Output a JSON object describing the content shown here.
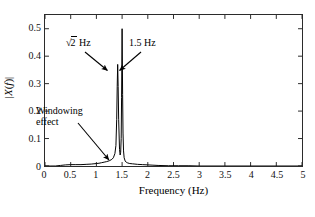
{
  "figure": {
    "background_color": "#ffffff",
    "line_color": "#000000",
    "axis_color": "#2b2b2b"
  },
  "annotations": {
    "peak_left": {
      "radical": "√",
      "radicand": "2",
      "unit": "Hz",
      "full_text": "√2 Hz"
    },
    "peak_right": {
      "text": "1.5 Hz"
    },
    "windowing": {
      "line1": "Windowing",
      "line2": "effect"
    }
  },
  "caption_sliver": {
    "text": ""
  },
  "chart_data": {
    "type": "line",
    "title": "",
    "xlabel": "Frequency (Hz)",
    "ylabel": "|X(f)|",
    "xlim": [
      0,
      5
    ],
    "ylim": [
      0,
      0.55
    ],
    "grid": false,
    "legend": null,
    "xticks": [
      0,
      0.5,
      1,
      1.5,
      2,
      2.5,
      3,
      3.5,
      4,
      4.5,
      5
    ],
    "xtick_labels": [
      "0",
      "0.5",
      "1",
      "1.5",
      "2",
      "2.5",
      "3",
      "3.5",
      "4",
      "4.5",
      "5"
    ],
    "yticks": [
      0,
      0.1,
      0.2,
      0.3,
      0.4,
      0.5
    ],
    "ytick_labels": [
      "0",
      "0.1",
      "0.2",
      "0.3",
      "0.4",
      "0.5"
    ],
    "peaks": [
      {
        "label": "√2 Hz",
        "x": 1.414,
        "y": 0.37
      },
      {
        "label": "1.5 Hz",
        "x": 1.5,
        "y": 0.5
      }
    ],
    "annotations": [
      {
        "text": "√2 Hz",
        "points_to_x": 1.414,
        "points_to_y": 0.33
      },
      {
        "text": "1.5 Hz",
        "points_to_x": 1.5,
        "points_to_y": 0.33
      },
      {
        "text": "Windowing effect",
        "points_to_x": 1.28,
        "points_to_y": 0.02
      }
    ],
    "series": [
      {
        "name": "|X(f)|",
        "x": [
          0,
          0.1,
          0.2,
          0.3,
          0.4,
          0.5,
          0.6,
          0.7,
          0.8,
          0.9,
          1.0,
          1.05,
          1.1,
          1.15,
          1.2,
          1.25,
          1.3,
          1.33,
          1.36,
          1.38,
          1.395,
          1.405,
          1.414,
          1.423,
          1.433,
          1.45,
          1.462,
          1.472,
          1.482,
          1.49,
          1.5,
          1.51,
          1.518,
          1.528,
          1.54,
          1.56,
          1.58,
          1.61,
          1.65,
          1.7,
          1.75,
          1.8,
          1.9,
          2.0,
          2.1,
          2.2,
          2.4,
          2.6,
          2.8,
          3.0,
          3.5,
          4.0,
          4.5,
          5.0
        ],
        "y": [
          0.0,
          0.0,
          0.0,
          0.002,
          0.004,
          0.005,
          0.005,
          0.005,
          0.006,
          0.007,
          0.009,
          0.01,
          0.012,
          0.014,
          0.016,
          0.019,
          0.024,
          0.03,
          0.045,
          0.075,
          0.17,
          0.29,
          0.37,
          0.29,
          0.17,
          0.06,
          0.04,
          0.05,
          0.1,
          0.25,
          0.5,
          0.26,
          0.12,
          0.055,
          0.03,
          0.018,
          0.014,
          0.011,
          0.009,
          0.008,
          0.007,
          0.006,
          0.005,
          0.004,
          0.003,
          0.002,
          0.001,
          0.001,
          0.001,
          0.0,
          0.0,
          0.0,
          0.0,
          0.0
        ]
      }
    ]
  }
}
